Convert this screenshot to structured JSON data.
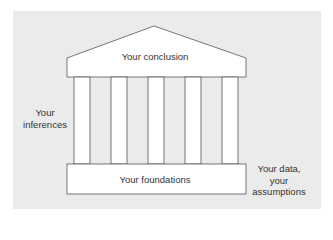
{
  "diagram": {
    "type": "temple-metaphor",
    "background_color": "#ebebeb",
    "shape_fill": "#ffffff",
    "stroke_color": "#555555",
    "roof": {
      "label": "Your conclusion"
    },
    "columns": {
      "count": 5
    },
    "base": {
      "label": "Your foundations"
    },
    "side_labels": {
      "left": {
        "line1": "Your",
        "line2": "inferences"
      },
      "right": {
        "line1": "Your data,",
        "line2": "your",
        "line3": "assumptions"
      }
    }
  }
}
